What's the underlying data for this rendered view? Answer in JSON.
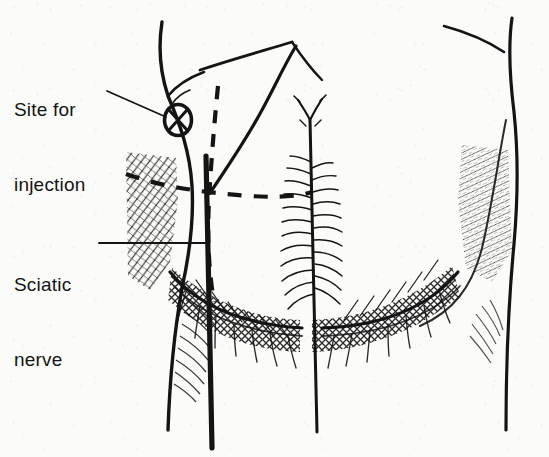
{
  "figure": {
    "style": "pen-and-ink line drawing",
    "background_color": "#fbfbf9",
    "ink_color": "#141414",
    "width": 549,
    "height": 457
  },
  "labels": [
    {
      "id": "site-for-injection",
      "line1": "Site for",
      "line2": "injection",
      "x": 14,
      "y": 47,
      "leader": "diagonal line to circled-x marker"
    },
    {
      "id": "sciatic-nerve",
      "line1": "Sciatic",
      "line2": "nerve",
      "x": 14,
      "y": 222,
      "leader": "horizontal line to thick nerve stroke"
    }
  ],
  "markers": {
    "injection_site": {
      "name": "circled-x-marker",
      "cx": 178,
      "cy": 120,
      "rx": 14,
      "ry": 16,
      "meaning": "upper outer quadrant injection point"
    }
  },
  "anatomy": {
    "quadrant_lines": {
      "style": "dashed",
      "vertical": "dashed vertical line dividing buttock into medial and lateral halves",
      "horizontal": "dashed curved line dividing buttock into upper and lower halves",
      "intersection_x": 208,
      "intersection_y": 192
    },
    "sciatic_nerve": {
      "style": "thick solid stroke",
      "description": "runs vertically down through the buttock into the thigh"
    },
    "gluteal_cleft": {
      "description": "central vertical cleft with feathered hatching"
    },
    "gluteal_folds": {
      "description": "inferior buttock creases with dense cross-hatch shading"
    },
    "shading": {
      "left_hip": "cross-hatched diagonal shading",
      "right_hip": "light diagonal hatching",
      "left_thigh": "curved contour hatching",
      "lower_buttocks": "dense cross-hatching"
    }
  },
  "colors": {
    "ink": "#141414",
    "ink_light": "#2a2a2a",
    "paper": "#fbfbf9"
  }
}
